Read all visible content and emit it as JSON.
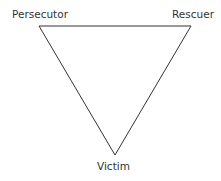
{
  "diagram": {
    "nodes": [
      {
        "id": "persecutor",
        "label": "Persecutor"
      },
      {
        "id": "rescuer",
        "label": "Rescuer"
      },
      {
        "id": "victim",
        "label": "Victim"
      }
    ],
    "line_color": "#333333",
    "text_color": "#333333"
  }
}
